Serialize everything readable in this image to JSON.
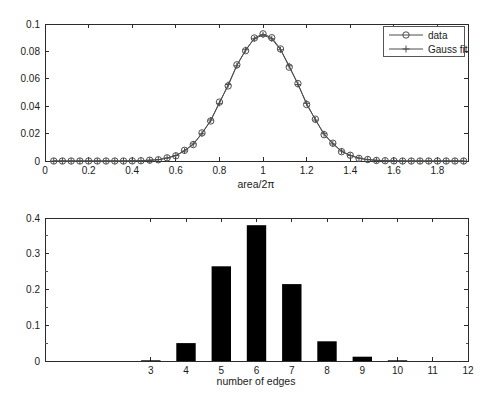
{
  "figure": {
    "background": "#ffffff",
    "text_color": "#1a1a1a",
    "axis_color": "#2b2b2b"
  },
  "chart_data": [
    {
      "type": "line",
      "title": "",
      "xlabel": "area/2π",
      "ylabel": "",
      "xlim": [
        0,
        1.94
      ],
      "ylim": [
        0,
        0.1
      ],
      "grid": false,
      "xticks": [
        0,
        0.2,
        0.4,
        0.6,
        0.8,
        1,
        1.2,
        1.4,
        1.6,
        1.8
      ],
      "xticklabels": [
        "0",
        "0.2",
        "0.4",
        "0.6",
        "0.8",
        "1",
        "1.2",
        "1.4",
        "1.6",
        "1.8"
      ],
      "yticks": [
        0,
        0.02,
        0.04,
        0.06,
        0.08,
        0.1
      ],
      "yticklabels": [
        "0",
        "0.02",
        "0.04",
        "0.06",
        "0.08",
        "0.1"
      ],
      "line_color": "#4d4d4d",
      "legend": {
        "position": "top-right",
        "entries": [
          {
            "label": "data",
            "marker": "circle"
          },
          {
            "label": "Gauss fit",
            "marker": "plus"
          }
        ]
      },
      "x": [
        0.04,
        0.08,
        0.12,
        0.16,
        0.2,
        0.24,
        0.28,
        0.32,
        0.36,
        0.4,
        0.44,
        0.48,
        0.52,
        0.56,
        0.6,
        0.64,
        0.68,
        0.72,
        0.76,
        0.8,
        0.84,
        0.88,
        0.92,
        0.96,
        1.0,
        1.04,
        1.08,
        1.12,
        1.16,
        1.2,
        1.24,
        1.28,
        1.32,
        1.36,
        1.4,
        1.44,
        1.48,
        1.52,
        1.56,
        1.6,
        1.64,
        1.68,
        1.72,
        1.76,
        1.8,
        1.84,
        1.88,
        1.92
      ],
      "series": [
        {
          "name": "data",
          "marker": "circle",
          "values": [
            0,
            0,
            0,
            0,
            0,
            0,
            0,
            0,
            0,
            0.0001,
            0.0002,
            0.0006,
            0.0009,
            0.0023,
            0.0038,
            0.0078,
            0.012,
            0.0205,
            0.0292,
            0.043,
            0.0548,
            0.0702,
            0.0805,
            0.0898,
            0.0928,
            0.09,
            0.0818,
            0.0685,
            0.0565,
            0.0412,
            0.0305,
            0.0192,
            0.013,
            0.0068,
            0.0042,
            0.0019,
            0.0011,
            0.0004,
            0.0002,
            0.0001,
            0,
            0,
            0,
            0,
            0,
            0,
            0,
            0
          ]
        },
        {
          "name": "Gauss fit",
          "marker": "plus",
          "values": [
            0,
            0,
            0,
            0,
            0,
            0,
            0,
            0,
            0,
            0.0001,
            0.0002,
            0.0005,
            0.001,
            0.0021,
            0.004,
            0.0073,
            0.0125,
            0.0199,
            0.0299,
            0.0421,
            0.0558,
            0.0695,
            0.0812,
            0.0892,
            0.092,
            0.0892,
            0.0812,
            0.0695,
            0.0558,
            0.0421,
            0.0299,
            0.0199,
            0.0125,
            0.0073,
            0.004,
            0.0021,
            0.001,
            0.0005,
            0.0002,
            0.0001,
            0,
            0,
            0,
            0,
            0,
            0,
            0,
            0
          ]
        }
      ],
      "gauss_fit_params": {
        "amplitude": 0.092,
        "mean": 1.0,
        "sigma": 0.16
      }
    },
    {
      "type": "bar",
      "title": "",
      "xlabel": "number of edges",
      "ylabel": "",
      "xlim": [
        0,
        12
      ],
      "ylim": [
        0,
        0.4
      ],
      "grid": false,
      "xticks": [
        3,
        4,
        5,
        6,
        7,
        8,
        9,
        10,
        11,
        12
      ],
      "xticklabels": [
        "3",
        "4",
        "5",
        "6",
        "7",
        "8",
        "9",
        "10",
        "11",
        "12"
      ],
      "yticks": [
        0,
        0.1,
        0.2,
        0.3,
        0.4
      ],
      "yticklabels": [
        "0",
        "0.1",
        "0.2",
        "0.3",
        "0.4"
      ],
      "yminorticks": [
        0.05,
        0.15,
        0.25,
        0.35
      ],
      "bar_color": "#000000",
      "bar_width": 0.55,
      "categories": [
        3,
        4,
        5,
        6,
        7,
        8,
        9,
        10,
        11,
        12
      ],
      "values": [
        0.002,
        0.05,
        0.265,
        0.38,
        0.215,
        0.055,
        0.012,
        0.002,
        0,
        0
      ]
    }
  ]
}
